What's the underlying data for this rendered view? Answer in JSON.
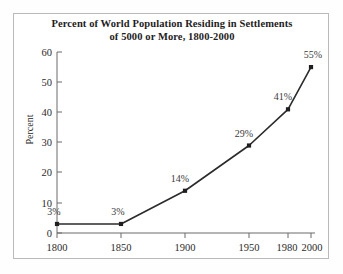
{
  "figure": {
    "title_line1": "Percent of World Population Residing in Settlements",
    "title_line2": "of 5000 or More, 1800-2000",
    "background_color": "#ffffff",
    "frame_color": "#b9b9b9",
    "line_color": "#2b2b2b",
    "text_color": "#2b2b2b"
  },
  "axes": {
    "ylabel": "Percent",
    "xlabel": "",
    "yticks": [
      "0",
      "10",
      "20",
      "30",
      "40",
      "50",
      "60"
    ],
    "xticks": [
      "1800",
      "1850",
      "1900",
      "1950",
      "1980",
      "2000"
    ]
  },
  "chart_data": {
    "type": "line",
    "title": "Percent of World Population Residing in Settlements of 5000 or More, 1800-2000",
    "xlabel": "",
    "ylabel": "Percent",
    "x": [
      1800,
      1850,
      1900,
      1950,
      1980,
      2000
    ],
    "categories": [
      "1800",
      "1850",
      "1900",
      "1950",
      "1980",
      "2000"
    ],
    "values": [
      3,
      3,
      14,
      29,
      41,
      55
    ],
    "point_labels": [
      "3%",
      "3%",
      "14%",
      "29%",
      "41%",
      "55%"
    ],
    "ylim": [
      0,
      60
    ],
    "xlim": [
      1800,
      2000
    ],
    "ytick_values": [
      0,
      10,
      20,
      30,
      40,
      50,
      60
    ],
    "xtick_values": [
      1800,
      1850,
      1900,
      1950,
      1980,
      2000
    ],
    "grid": false,
    "legend": false,
    "marker": "square",
    "series": [
      {
        "name": "Percent of world population in settlements of 5000 or more",
        "values": [
          3,
          3,
          14,
          29,
          41,
          55
        ]
      }
    ]
  }
}
